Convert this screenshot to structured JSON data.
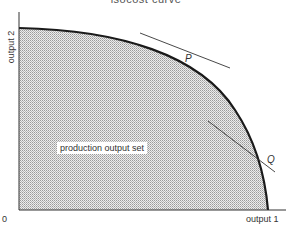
{
  "figure": {
    "title": "isocost curve",
    "y_axis_label": "output 2",
    "x_axis_label": "output 1",
    "origin_label": "0",
    "region_label": "production output set",
    "points": [
      {
        "name": "P",
        "label": "P"
      },
      {
        "name": "Q",
        "label": "Q"
      }
    ],
    "colors": {
      "curve": "#1a1a1a",
      "fill": "#d9d9d9",
      "axes": "#333333",
      "tangent": "#333333"
    }
  }
}
